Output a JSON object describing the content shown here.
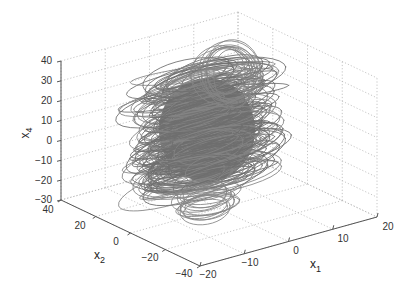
{
  "chart_data": {
    "type": "line3d",
    "title": "",
    "xlabel": "x1",
    "ylabel": "x2",
    "zlabel": "x4",
    "xlim": [
      -20,
      20
    ],
    "ylim": [
      -40,
      40
    ],
    "zlim": [
      -30,
      40
    ],
    "xticks": [
      -20,
      -10,
      0,
      10,
      20
    ],
    "yticks": [
      -40,
      -20,
      0,
      20,
      40
    ],
    "zticks": [
      -30,
      -20,
      -10,
      0,
      10,
      20,
      30,
      40
    ],
    "grid": true,
    "legend": null,
    "series": [
      {
        "name": "trajectory",
        "color": "#6e6e6e",
        "approx_extent": {
          "x1": [
            -12,
            12
          ],
          "x2": [
            -25,
            25
          ],
          "x4": [
            -25,
            30
          ]
        },
        "note": "dense chaotic trajectory centered near origin"
      }
    ]
  },
  "labels": {
    "x1_main": "x",
    "x1_sub": "1",
    "x2_main": "x",
    "x2_sub": "2",
    "x4_main": "x",
    "x4_sub": "4"
  },
  "tick_text": {
    "z": [
      "40",
      "30",
      "20",
      "10",
      "0",
      "−10",
      "−20",
      "−30"
    ],
    "y": [
      "40",
      "20",
      "0",
      "−20",
      "−40"
    ],
    "x": [
      "−20",
      "−10",
      "0",
      "10",
      "20"
    ]
  },
  "colors": {
    "trajectory": "#6e6e6e",
    "trajectory_outer": "#858585",
    "grid": "#b8b8b8",
    "axis": "#555555"
  }
}
